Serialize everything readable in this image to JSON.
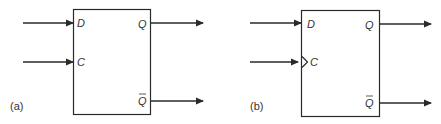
{
  "figure": {
    "panels": [
      {
        "caption": "(a)",
        "title": "D latch",
        "inputs": [
          {
            "label": "D"
          },
          {
            "label": "C",
            "edge_triggered": false
          }
        ],
        "outputs": [
          {
            "label": "Q"
          },
          {
            "label": "Q",
            "overline": true
          }
        ]
      },
      {
        "caption": "(b)",
        "title": "D flip-flop",
        "inputs": [
          {
            "label": "D"
          },
          {
            "label": "C",
            "edge_triggered": true
          }
        ],
        "outputs": [
          {
            "label": "Q"
          },
          {
            "label": "Q",
            "overline": true
          }
        ]
      }
    ],
    "colors": {
      "line": "#2a2a2a",
      "text": "#333333",
      "background": "#ffffff"
    }
  }
}
